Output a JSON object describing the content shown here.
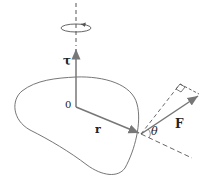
{
  "diagram": {
    "labels": {
      "torque": "τ",
      "origin": "0",
      "position": "r",
      "force": "F",
      "angle": "θ"
    },
    "colors": {
      "vector": "#777777",
      "outline": "#666666",
      "dashed": "#555555",
      "text": "#222222"
    }
  }
}
